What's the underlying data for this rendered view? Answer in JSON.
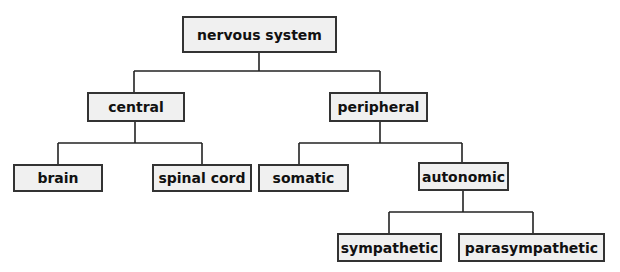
{
  "diagram": {
    "type": "tree",
    "colors": {
      "box_fill": "#f0f0f0",
      "box_border": "#333333",
      "line": "#222222",
      "text": "#111111"
    },
    "nodes": {
      "root": {
        "label": "nervous system"
      },
      "central": {
        "label": "central",
        "parent": "nervous system"
      },
      "peripheral": {
        "label": "peripheral",
        "parent": "nervous system"
      },
      "brain": {
        "label": "brain",
        "parent": "central"
      },
      "spinal_cord": {
        "label": "spinal cord",
        "parent": "central"
      },
      "somatic": {
        "label": "somatic",
        "parent": "peripheral"
      },
      "autonomic": {
        "label": "autonomic",
        "parent": "peripheral"
      },
      "sympathetic": {
        "label": "sympathetic",
        "parent": "autonomic"
      },
      "parasympathetic": {
        "label": "parasympathetic",
        "parent": "autonomic"
      }
    }
  }
}
